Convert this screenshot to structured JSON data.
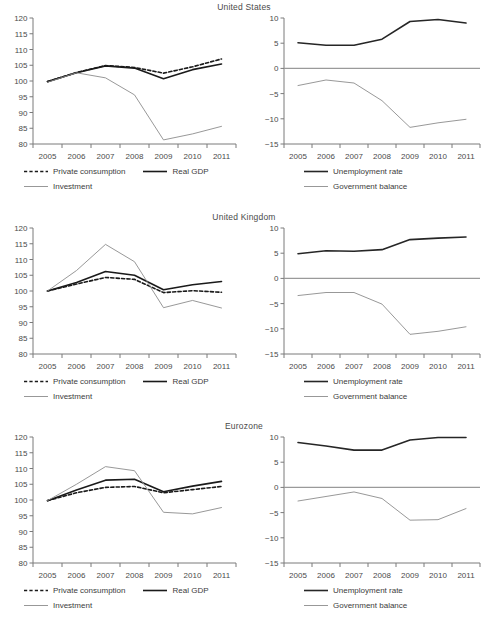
{
  "chart_data": [
    {
      "type": "line",
      "title": "United States",
      "panel": "left",
      "xlabel": "",
      "ylabel": "",
      "x": [
        2005,
        2006,
        2007,
        2008,
        2009,
        2010,
        2011
      ],
      "xtick_labels": [
        "2005",
        "2006",
        "2007",
        "2008",
        "2009",
        "2010",
        "2011"
      ],
      "ytick_labels": [
        "80",
        "85",
        "90",
        "95",
        "100",
        "105",
        "110",
        "115",
        "120"
      ],
      "ylim": [
        80,
        120
      ],
      "grid": false,
      "legend_position": "below",
      "series": [
        {
          "name": "Private consumption",
          "style": "dashed",
          "color": "#1a1a1a",
          "values": [
            99.8,
            102.7,
            104.9,
            104.3,
            102.5,
            104.5,
            107.0
          ]
        },
        {
          "name": "Real GDP",
          "style": "solid-thick",
          "color": "#1a1a1a",
          "values": [
            99.8,
            102.6,
            104.8,
            104.1,
            100.7,
            103.6,
            105.4
          ]
        },
        {
          "name": "Investment",
          "style": "solid-thin",
          "color": "#8c8c8c",
          "values": [
            99.6,
            102.6,
            101.0,
            95.6,
            81.3,
            83.2,
            85.6
          ]
        }
      ]
    },
    {
      "type": "line",
      "title": "United States",
      "panel": "right",
      "xlabel": "",
      "ylabel": "",
      "x": [
        2005,
        2006,
        2007,
        2008,
        2009,
        2010,
        2011
      ],
      "xtick_labels": [
        "2005",
        "2006",
        "2007",
        "2008",
        "2009",
        "2010",
        "2011"
      ],
      "ytick_labels": [
        "-15",
        "-10",
        "-5",
        "0",
        "5",
        "10"
      ],
      "ylim": [
        -15,
        10
      ],
      "zero_line": true,
      "grid": false,
      "legend_position": "below",
      "series": [
        {
          "name": "Unemployment rate",
          "style": "solid-thick",
          "color": "#262626",
          "values": [
            5.1,
            4.6,
            4.6,
            5.8,
            9.3,
            9.7,
            9.0
          ]
        },
        {
          "name": "Government balance",
          "style": "solid-thin",
          "color": "#8c8c8c",
          "values": [
            -3.4,
            -2.3,
            -2.9,
            -6.4,
            -11.7,
            -10.8,
            -10.1
          ]
        }
      ]
    },
    {
      "type": "line",
      "title": "United Kingdom",
      "panel": "left",
      "xlabel": "",
      "ylabel": "",
      "x": [
        2005,
        2006,
        2007,
        2008,
        2009,
        2010,
        2011
      ],
      "xtick_labels": [
        "2005",
        "2006",
        "2007",
        "2008",
        "2009",
        "2010",
        "2011"
      ],
      "ytick_labels": [
        "80",
        "85",
        "90",
        "95",
        "100",
        "105",
        "110",
        "115",
        "120"
      ],
      "ylim": [
        80,
        120
      ],
      "grid": false,
      "legend_position": "below",
      "series": [
        {
          "name": "Private consumption",
          "style": "dashed",
          "color": "#1a1a1a",
          "values": [
            100.0,
            102.2,
            104.3,
            103.7,
            99.5,
            100.1,
            99.6
          ]
        },
        {
          "name": "Real GDP",
          "style": "solid-thick",
          "color": "#1a1a1a",
          "values": [
            100.0,
            102.7,
            106.2,
            105.0,
            100.4,
            102.0,
            103.0
          ]
        },
        {
          "name": "Investment",
          "style": "solid-thin",
          "color": "#8c8c8c",
          "values": [
            100.0,
            106.5,
            114.8,
            109.3,
            94.7,
            97.0,
            94.6
          ]
        }
      ]
    },
    {
      "type": "line",
      "title": "United Kingdom",
      "panel": "right",
      "xlabel": "",
      "ylabel": "",
      "x": [
        2005,
        2006,
        2007,
        2008,
        2009,
        2010,
        2011
      ],
      "xtick_labels": [
        "2005",
        "2006",
        "2007",
        "2008",
        "2009",
        "2010",
        "2011"
      ],
      "ytick_labels": [
        "-15",
        "-10",
        "-5",
        "0",
        "5",
        "10"
      ],
      "ylim": [
        -15,
        10
      ],
      "zero_line": true,
      "grid": false,
      "legend_position": "below",
      "series": [
        {
          "name": "Unemployment rate",
          "style": "solid-thick",
          "color": "#262626",
          "values": [
            4.9,
            5.5,
            5.4,
            5.7,
            7.7,
            8.0,
            8.2
          ]
        },
        {
          "name": "Government balance",
          "style": "solid-thin",
          "color": "#8c8c8c",
          "values": [
            -3.4,
            -2.8,
            -2.8,
            -5.1,
            -11.1,
            -10.5,
            -9.6
          ]
        }
      ]
    },
    {
      "type": "line",
      "title": "Eurozone",
      "panel": "left",
      "xlabel": "",
      "ylabel": "",
      "x": [
        2005,
        2006,
        2007,
        2008,
        2009,
        2010,
        2011
      ],
      "xtick_labels": [
        "2005",
        "2006",
        "2007",
        "2008",
        "2009",
        "2010",
        "2011"
      ],
      "ytick_labels": [
        "80",
        "85",
        "90",
        "95",
        "100",
        "105",
        "110",
        "115",
        "120"
      ],
      "ylim": [
        80,
        120
      ],
      "grid": false,
      "legend_position": "below",
      "series": [
        {
          "name": "Private consumption",
          "style": "dashed",
          "color": "#1a1a1a",
          "values": [
            99.8,
            102.3,
            104.0,
            104.3,
            102.3,
            103.3,
            104.3
          ]
        },
        {
          "name": "Real GDP",
          "style": "solid-thick",
          "color": "#1a1a1a",
          "values": [
            99.8,
            103.2,
            106.3,
            106.6,
            102.6,
            104.4,
            105.9
          ]
        },
        {
          "name": "Investment",
          "style": "solid-thin",
          "color": "#8c8c8c",
          "values": [
            99.8,
            105.0,
            110.6,
            109.3,
            96.1,
            95.6,
            97.6
          ]
        }
      ]
    },
    {
      "type": "line",
      "title": "Eurozone",
      "panel": "right",
      "xlabel": "",
      "ylabel": "",
      "x": [
        2005,
        2006,
        2007,
        2008,
        2009,
        2010,
        2011
      ],
      "xtick_labels": [
        "2005",
        "2006",
        "2007",
        "2008",
        "2009",
        "2010",
        "2011"
      ],
      "ytick_labels": [
        "-15",
        "-10",
        "-5",
        "0",
        "5",
        "10"
      ],
      "ylim": [
        -15,
        10
      ],
      "zero_line": true,
      "grid": false,
      "legend_position": "below",
      "series": [
        {
          "name": "Unemployment rate",
          "style": "solid-thick",
          "color": "#262626",
          "values": [
            8.9,
            8.2,
            7.4,
            7.4,
            9.4,
            9.9,
            9.9
          ]
        },
        {
          "name": "Government balance",
          "style": "solid-thin",
          "color": "#8c8c8c",
          "values": [
            -2.7,
            -1.8,
            -0.9,
            -2.2,
            -6.5,
            -6.4,
            -4.2
          ]
        }
      ]
    }
  ],
  "rows": [
    {
      "title": "United States"
    },
    {
      "title": "United Kingdom"
    },
    {
      "title": "Eurozone"
    }
  ],
  "legends": {
    "left": {
      "items": [
        {
          "label": "Private consumption",
          "style": "dashed",
          "color": "#1a1a1a"
        },
        {
          "label": "Real GDP",
          "style": "solid-thick",
          "color": "#1a1a1a"
        },
        {
          "label": "Investment",
          "style": "solid-thin",
          "color": "#8c8c8c"
        }
      ]
    },
    "right": {
      "items": [
        {
          "label": "Unemployment rate",
          "style": "solid-thick",
          "color": "#262626"
        },
        {
          "label": "Government balance",
          "style": "solid-thin",
          "color": "#8c8c8c"
        }
      ]
    }
  },
  "colors": {
    "axis": "#7a7a7a",
    "dark_series": "#1a1a1a",
    "light_series": "#8c8c8c",
    "text": "#4a4a4a",
    "background": "#ffffff"
  }
}
